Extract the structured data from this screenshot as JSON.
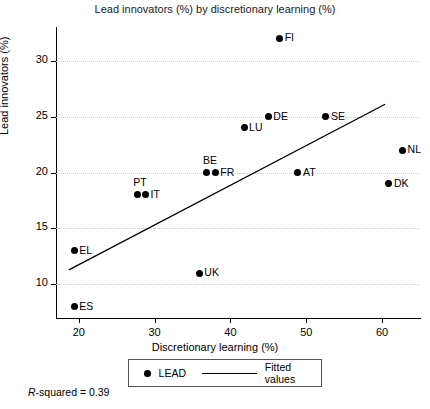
{
  "chart_data": {
    "type": "scatter",
    "title": "Lead innovators (%) by  discretionary learning (%)",
    "xlabel": "Discretionary learning (%)",
    "ylabel": "Lead innovators (%)",
    "xlim": [
      17,
      65
    ],
    "ylim": [
      7,
      33
    ],
    "xticks": [
      20,
      30,
      40,
      50,
      60
    ],
    "yticks": [
      10,
      15,
      20,
      25,
      30
    ],
    "grid": "horizontal-dotted",
    "series_name": "LEAD",
    "points": [
      {
        "label": "FI",
        "x": 46.5,
        "y": 32.0,
        "label_pos": "right"
      },
      {
        "label": "DE",
        "x": 45.0,
        "y": 25.0,
        "label_pos": "right"
      },
      {
        "label": "SE",
        "x": 52.6,
        "y": 25.0,
        "label_pos": "right"
      },
      {
        "label": "LU",
        "x": 41.8,
        "y": 24.0,
        "label_pos": "right"
      },
      {
        "label": "NL",
        "x": 62.7,
        "y": 22.0,
        "label_pos": "right"
      },
      {
        "label": "BE",
        "x": 36.9,
        "y": 20.0,
        "label_pos": "above"
      },
      {
        "label": "FR",
        "x": 38.0,
        "y": 20.0,
        "label_pos": "right"
      },
      {
        "label": "AT",
        "x": 48.9,
        "y": 20.0,
        "label_pos": "right"
      },
      {
        "label": "DK",
        "x": 60.9,
        "y": 19.0,
        "label_pos": "right"
      },
      {
        "label": "PT",
        "x": 27.7,
        "y": 18.0,
        "label_pos": "above"
      },
      {
        "label": "IT",
        "x": 28.8,
        "y": 18.0,
        "label_pos": "right"
      },
      {
        "label": "EL",
        "x": 19.4,
        "y": 13.0,
        "label_pos": "right"
      },
      {
        "label": "UK",
        "x": 35.9,
        "y": 11.0,
        "label_pos": "right"
      },
      {
        "label": "ES",
        "x": 19.4,
        "y": 8.0,
        "label_pos": "right"
      }
    ],
    "fit_line": {
      "x1": 18.7,
      "y1": 11.3,
      "x2": 60.4,
      "y2": 26.1
    },
    "annotation": "R-squared = 0.39",
    "annotation_prefix": "R",
    "annotation_rest": "-squared = 0.39",
    "legend": {
      "position": "below-axis",
      "entries": [
        {
          "label": "LEAD",
          "marker": "dot"
        },
        {
          "label": "Fitted values",
          "marker": "line"
        }
      ]
    }
  },
  "colors": {
    "marker": "#000000",
    "grid": "#c9c9c9",
    "axis": "#000000",
    "background": "#ffffff"
  }
}
